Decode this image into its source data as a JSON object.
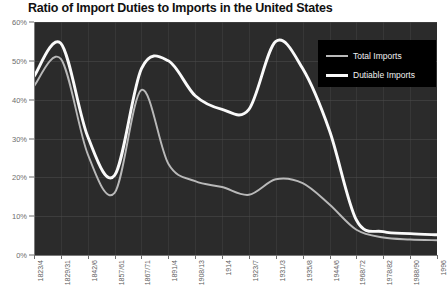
{
  "chart_data": {
    "type": "line",
    "title": "Ratio of Import Duties to Imports in the United States",
    "xlabel": "",
    "ylabel": "",
    "ylim": [
      0,
      60
    ],
    "yticks": [
      0,
      10,
      20,
      30,
      40,
      50,
      60
    ],
    "ytick_labels": [
      "0%",
      "10%",
      "20%",
      "30%",
      "40%",
      "50%",
      "60%"
    ],
    "grid": true,
    "legend_position": "upper right",
    "categories": [
      "1823/4",
      "1829/31",
      "1842/6",
      "1857/61",
      "1867/71",
      "1891/4",
      "1908/13",
      "1914",
      "1923/7",
      "1931/3",
      "1935/8",
      "1944/6",
      "1968/72",
      "1978/82",
      "1988/90",
      "1996"
    ],
    "series": [
      {
        "name": "Total Imports",
        "color": "#b9b9b9",
        "values": [
          43.5,
          50.5,
          26.0,
          16.0,
          42.5,
          23.5,
          19.0,
          17.5,
          15.5,
          19.5,
          18.5,
          13.0,
          6.5,
          4.5,
          4.0,
          3.8
        ]
      },
      {
        "name": "Dutiable Imports",
        "color": "#fafafa",
        "values": [
          46.0,
          54.5,
          30.5,
          20.5,
          48.0,
          50.0,
          41.0,
          37.5,
          37.5,
          55.0,
          48.0,
          32.0,
          9.0,
          6.0,
          5.5,
          5.2
        ]
      }
    ]
  },
  "legend": {
    "total_label": "Total Imports",
    "dutiable_label": "Dutiable Imports"
  }
}
